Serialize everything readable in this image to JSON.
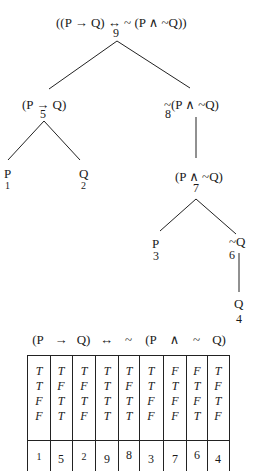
{
  "tree": {
    "root": {
      "formula": "((P → Q) ↔ ~ (P ∧ ~Q))",
      "label": "9"
    },
    "left": {
      "formula": "(P → Q)",
      "label": "5"
    },
    "right": {
      "formula": "~(P ∧ ~Q)",
      "label": "8"
    },
    "leaf_p1": {
      "formula": "P",
      "label": "1"
    },
    "leaf_q2": {
      "formula": "Q",
      "label": "2"
    },
    "conj": {
      "formula": "(P ∧ ~Q)",
      "label": "7"
    },
    "leaf_p3": {
      "formula": "P",
      "label": "3"
    },
    "negq": {
      "formula": "~Q",
      "label": "6"
    },
    "leaf_q4": {
      "formula": "Q",
      "label": "4"
    }
  },
  "table": {
    "headers": [
      "(P",
      "→",
      "Q)",
      "↔",
      "~",
      "(P",
      "∧",
      "~",
      "Q)"
    ],
    "columns": [
      [
        "T",
        "T",
        "F",
        "F"
      ],
      [
        "T",
        "F",
        "T",
        "T"
      ],
      [
        "T",
        "F",
        "T",
        "F"
      ],
      [
        "T",
        "T",
        "T",
        "T"
      ],
      [
        "T",
        "F",
        "T",
        "T"
      ],
      [
        "T",
        "T",
        "F",
        "F"
      ],
      [
        "F",
        "T",
        "F",
        "F"
      ],
      [
        "F",
        "T",
        "F",
        "T"
      ],
      [
        "T",
        "F",
        "T",
        "F"
      ]
    ],
    "order": [
      "1",
      "5",
      "2",
      "9",
      "8",
      "3",
      "7",
      "6",
      "4"
    ]
  }
}
